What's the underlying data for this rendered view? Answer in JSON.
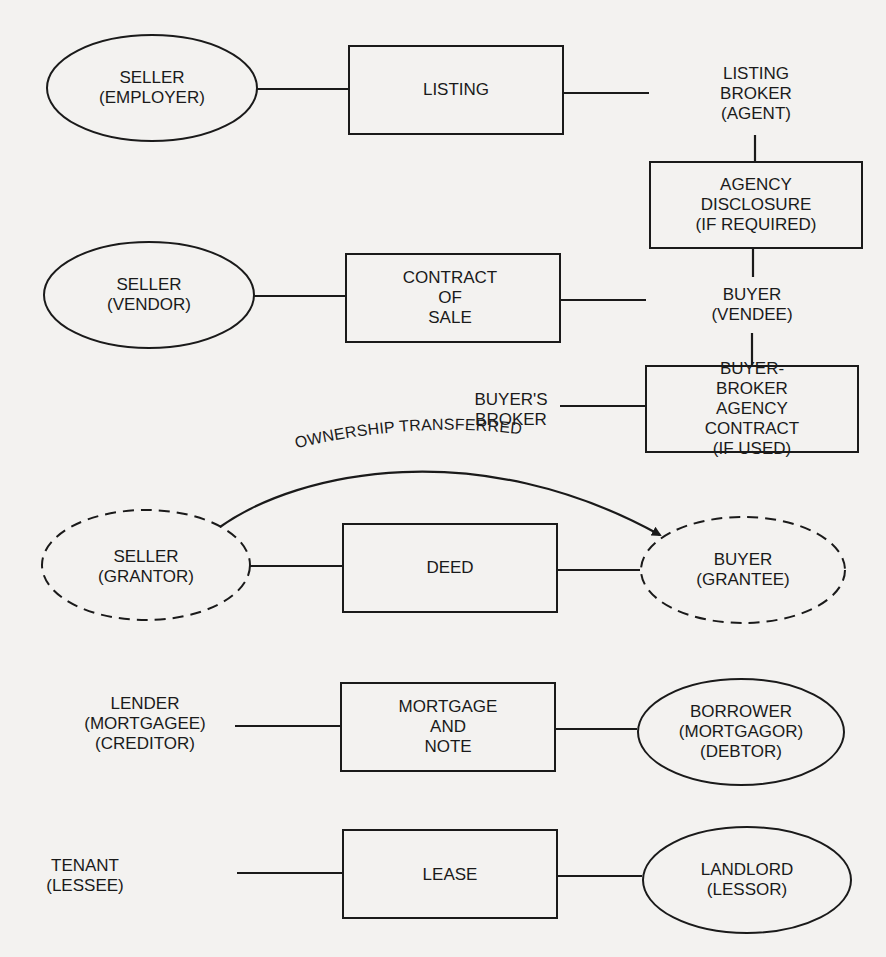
{
  "diagram": {
    "rows": [
      {
        "left": "SELLER\n(EMPLOYER)",
        "document": "LISTING",
        "right": "LISTING\nBROKER\n(AGENT)"
      },
      {
        "side_box": "AGENCY\nDISCLOSURE\n(IF REQUIRED)"
      },
      {
        "left": "SELLER\n(VENDOR)",
        "document": "CONTRACT\nOF\nSALE",
        "right": "BUYER\n(VENDEE)"
      },
      {
        "left": "BUYER'S\nBROKER",
        "document": "BUYER-BROKER\nAGENCY CONTRACT\n(IF USED)"
      },
      {
        "arc_label": "OWNERSHIP TRANSFERRED",
        "left": "SELLER\n(GRANTOR)",
        "document": "DEED",
        "right": "BUYER\n(GRANTEE)"
      },
      {
        "left": "LENDER\n(MORTGAGEE)\n(CREDITOR)",
        "document": "MORTGAGE\nAND\nNOTE",
        "right": "BORROWER\n(MORTGAGOR)\n(DEBTOR)"
      },
      {
        "left": "TENANT\n(LESSEE)",
        "document": "LEASE",
        "right": "LANDLORD\n(LESSOR)"
      }
    ]
  },
  "colors": {
    "background": "#f3f2f0",
    "ink": "#1a1a1a"
  }
}
